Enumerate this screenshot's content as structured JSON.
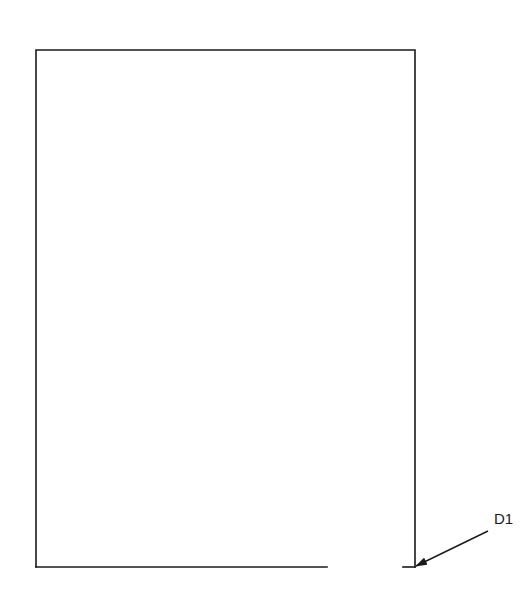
{
  "diagram": {
    "title": "",
    "stroke_color": "#1a1a1a",
    "background": "#ffffff",
    "outline": {
      "top_left": [
        36,
        50
      ],
      "top_right": [
        415,
        50
      ],
      "bottom_right": [
        415,
        567
      ],
      "bottom_left": [
        36,
        567
      ],
      "bottom_gap": {
        "from_x": 327,
        "to_x": 403
      }
    },
    "callouts": [
      {
        "label": "D1",
        "label_position": [
          494,
          524
        ],
        "leader_start": [
          488,
          531
        ],
        "arrow_tip": [
          415,
          567
        ]
      }
    ]
  }
}
